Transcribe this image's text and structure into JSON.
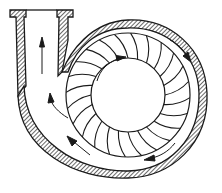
{
  "diagram": {
    "type": "centrifugal-pump-cross-section",
    "colors": {
      "background": "#ffffff",
      "line": "#1a1a1a",
      "hatch": "#2a2a2a"
    },
    "components": {
      "outlet_pipe": {
        "label": "",
        "direction": "up"
      },
      "volute_casing": {
        "label": ""
      },
      "impeller": {
        "label": "",
        "blade_count": 24
      },
      "hub": {
        "label": ""
      }
    },
    "flow_arrows": [
      {
        "id": "outlet-arrow",
        "direction": "up"
      },
      {
        "id": "left-volute-arrow-upper",
        "direction": "up"
      },
      {
        "id": "left-volute-arrow-lower",
        "direction": "up-left"
      },
      {
        "id": "right-volute-arrow",
        "direction": "down"
      },
      {
        "id": "bottom-volute-arrow",
        "direction": "left"
      },
      {
        "id": "rotation-arrow",
        "direction": "clockwise"
      }
    ]
  }
}
